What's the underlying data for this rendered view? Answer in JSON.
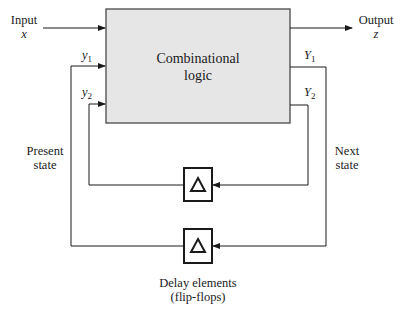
{
  "diagram": {
    "type": "sequential-circuit-block-diagram",
    "block": {
      "line1": "Combinational",
      "line2": "logic",
      "fill": "#e6e6e6",
      "stroke": "#555555"
    },
    "input": {
      "label": "Input",
      "var": "x"
    },
    "output": {
      "label": "Output",
      "var": "z"
    },
    "present_state": {
      "label_line1": "Present",
      "label_line2": "state",
      "vars": [
        {
          "sym": "y",
          "sub": "1"
        },
        {
          "sym": "y",
          "sub": "2"
        }
      ]
    },
    "next_state": {
      "label_line1": "Next",
      "label_line2": "state",
      "vars": [
        {
          "sym": "Y",
          "sub": "1"
        },
        {
          "sym": "Y",
          "sub": "2"
        }
      ]
    },
    "delay_elements": {
      "label_line1": "Delay elements",
      "label_line2": "(flip-flops)",
      "count": 2,
      "symbol": "triangle"
    }
  }
}
